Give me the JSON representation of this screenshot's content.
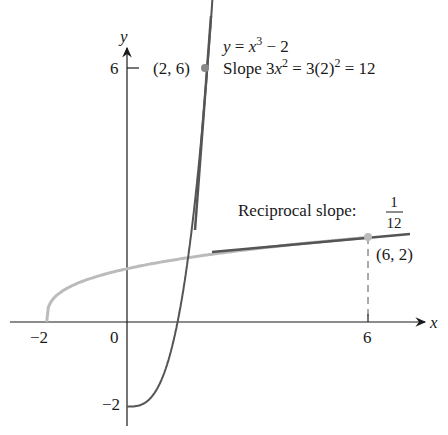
{
  "figure": {
    "curve_label": {
      "y": "y",
      "eq": " = ",
      "x": "x",
      "exp": "3",
      "rest": " − 2"
    },
    "slope_label": {
      "pre": "Slope 3",
      "x": "x",
      "exp": "2",
      "mid": " = 3(2)",
      "exp2": "2",
      "post": " = 12"
    },
    "point_a_label": "(2, 6)",
    "point_b_label": "(6, 2)",
    "reciprocal_label": "Reciprocal slope: ",
    "reciprocal_num": "1",
    "reciprocal_den": "12",
    "axis_x_label": "x",
    "axis_y_label": "y",
    "ticks_x": [
      "−2",
      "0",
      "6"
    ],
    "ticks_y": [
      "6",
      "−2"
    ]
  },
  "colors": {
    "curve": "#555555",
    "inverse_curve": "#bbbbbb",
    "tangent": "#555555",
    "axis": "#1a1a1a",
    "point": "#888888"
  }
}
